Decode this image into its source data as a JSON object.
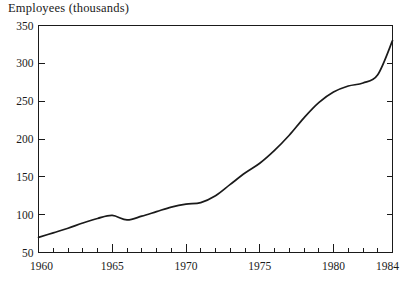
{
  "chart_data": {
    "type": "line",
    "title": "Employees (thousands)",
    "xlabel": "",
    "ylabel": "",
    "xlim": [
      1960,
      1984
    ],
    "ylim": [
      50,
      350
    ],
    "grid": false,
    "legend": "none",
    "y_ticks": [
      50,
      100,
      150,
      200,
      250,
      300,
      350
    ],
    "y_tick_labels": [
      "50",
      "100",
      "150",
      "200",
      "250",
      "300",
      "350"
    ],
    "x_ticks": [
      1960,
      1961,
      1962,
      1963,
      1964,
      1965,
      1966,
      1967,
      1968,
      1969,
      1970,
      1971,
      1972,
      1973,
      1974,
      1975,
      1976,
      1977,
      1978,
      1979,
      1980,
      1981,
      1982,
      1983,
      1984
    ],
    "x_tick_labels_major": [
      "1960",
      "1965",
      "1970",
      "1975",
      "1980",
      "1984"
    ],
    "x_major_ticks": [
      1960,
      1965,
      1970,
      1975,
      1980,
      1984
    ],
    "line_color": "#1a1a1a",
    "background_color": "#ffffff",
    "x": [
      1960,
      1961,
      1962,
      1963,
      1964,
      1965,
      1966,
      1967,
      1968,
      1969,
      1970,
      1971,
      1972,
      1973,
      1974,
      1975,
      1976,
      1977,
      1978,
      1979,
      1980,
      1981,
      1982,
      1983,
      1984
    ],
    "values": [
      70,
      76,
      82,
      89,
      95,
      99,
      93,
      98,
      104,
      110,
      114,
      116,
      125,
      140,
      155,
      168,
      185,
      205,
      228,
      248,
      262,
      270,
      274,
      285,
      330
    ],
    "series": [
      {
        "name": "Employees",
        "values": [
          70,
          76,
          82,
          89,
          95,
          99,
          93,
          98,
          104,
          110,
          114,
          116,
          125,
          140,
          155,
          168,
          185,
          205,
          228,
          248,
          262,
          270,
          274,
          285,
          330
        ]
      }
    ],
    "annotations": []
  }
}
